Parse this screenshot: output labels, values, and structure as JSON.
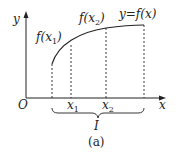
{
  "diagram": {
    "caption": "(a)",
    "axes": {
      "x_label": "x",
      "y_label": "y",
      "origin_label": "O"
    },
    "curve_label": "y=f(x)",
    "points": [
      {
        "name": "x1",
        "base": "x",
        "sub": "1",
        "value_label_pre": "f(",
        "value_label_var": "x",
        "value_label_sub": "1",
        "value_label_post": ")"
      },
      {
        "name": "x2",
        "base": "x",
        "sub": "2",
        "value_label_pre": "f(",
        "value_label_var": "x",
        "value_label_sub": "2",
        "value_label_post": ")"
      }
    ],
    "interval_label": "I"
  }
}
